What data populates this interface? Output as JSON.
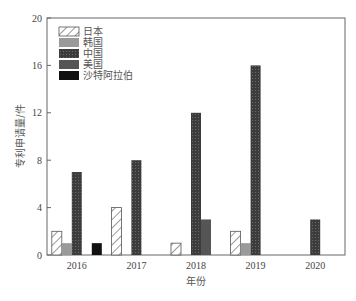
{
  "chart_data": {
    "type": "bar",
    "title": "",
    "xlabel": "年份",
    "ylabel": "专利申请量/件",
    "ylim": [
      0,
      20
    ],
    "yticks": [
      0,
      4,
      8,
      12,
      16,
      20
    ],
    "categories": [
      "2016",
      "2017",
      "2018",
      "2019",
      "2020"
    ],
    "series": [
      {
        "name": "日本",
        "values": [
          2,
          4,
          1,
          2,
          0
        ],
        "pattern": "hatch",
        "color": "#ffffff"
      },
      {
        "name": "韩国",
        "values": [
          1,
          0,
          0,
          1,
          0
        ],
        "pattern": "solid",
        "color": "#9a9a9a"
      },
      {
        "name": "中国",
        "values": [
          7,
          8,
          12,
          16,
          3
        ],
        "pattern": "crosshatch",
        "color": "#3a3a3a"
      },
      {
        "name": "美国",
        "values": [
          0,
          0,
          3,
          0,
          0
        ],
        "pattern": "solid",
        "color": "#555555"
      },
      {
        "name": "沙特阿拉伯",
        "values": [
          1,
          0,
          0,
          0,
          0
        ],
        "pattern": "solid",
        "color": "#111111"
      }
    ],
    "grid": false,
    "legend_position": "upper left"
  },
  "labels": {
    "xlabel": "年份",
    "ylabel": "专利申请量/件"
  }
}
